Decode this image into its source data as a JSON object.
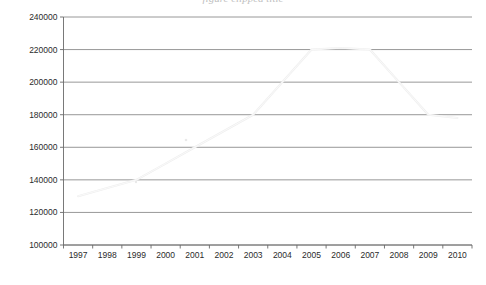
{
  "title_fragment": "figure clipped title",
  "chart_data": {
    "type": "line",
    "title": "",
    "xlabel": "",
    "ylabel": "",
    "categories": [
      "1997",
      "1998",
      "1999",
      "2000",
      "2001",
      "2002",
      "2003",
      "2004",
      "2005",
      "2006",
      "2007",
      "2008",
      "2009",
      "2010"
    ],
    "values": [
      130000,
      135000,
      140000,
      150000,
      160000,
      170000,
      180000,
      200000,
      220000,
      221000,
      220000,
      200000,
      180000,
      178000
    ],
    "series": [
      {
        "name": "series-1",
        "color": "#efefef",
        "values": [
          130000,
          135000,
          140000,
          150000,
          160000,
          170000,
          180000,
          200000,
          220000,
          221000,
          220000,
          200000,
          180000,
          178000
        ]
      }
    ],
    "ylim": [
      100000,
      240000
    ],
    "ytick_labels": [
      "240000",
      "220000",
      "200000",
      "180000",
      "160000",
      "140000",
      "120000",
      "100000"
    ],
    "ytick_values": [
      240000,
      220000,
      200000,
      180000,
      160000,
      140000,
      120000,
      100000
    ],
    "ystep": 20000,
    "grid": true,
    "legend": false,
    "legend_position": "none",
    "colors": {
      "grid": "#7d7d7d",
      "axis": "#6a6a6a",
      "line": "#efefef",
      "text": "#2b2b2b",
      "background": "#ffffff"
    }
  }
}
